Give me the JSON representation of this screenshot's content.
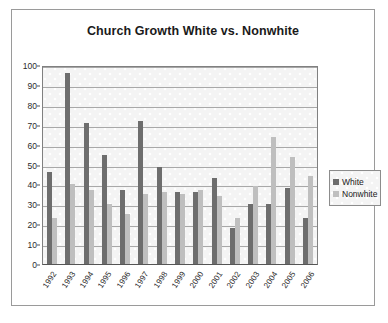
{
  "chart_data": {
    "type": "bar",
    "title": "Church Growth White vs. Nonwhite",
    "xlabel": "",
    "ylabel": "",
    "ylim": [
      0,
      100
    ],
    "ytick_step": 10,
    "yticks": [
      0,
      10,
      20,
      30,
      40,
      50,
      60,
      70,
      80,
      90,
      100
    ],
    "grid": true,
    "legend_position": "right",
    "categories": [
      "1992",
      "1993",
      "1994",
      "1995",
      "1996",
      "1997",
      "1998",
      "1999",
      "2000",
      "2001",
      "2002",
      "2003",
      "2004",
      "2005",
      "2006"
    ],
    "series": [
      {
        "name": "White",
        "color": "#6d6d6d",
        "values": [
          46,
          96,
          71,
          55,
          37,
          72,
          49,
          36,
          36,
          43,
          18,
          30,
          30,
          38,
          23
        ]
      },
      {
        "name": "Nonwhite",
        "color": "#bfbfbf",
        "values": [
          23,
          40,
          37,
          30,
          25,
          35,
          36,
          35,
          37,
          34,
          23,
          39,
          64,
          54,
          44
        ]
      }
    ]
  },
  "legend": {
    "items": [
      {
        "label": "White"
      },
      {
        "label": "Nonwhite"
      }
    ]
  }
}
